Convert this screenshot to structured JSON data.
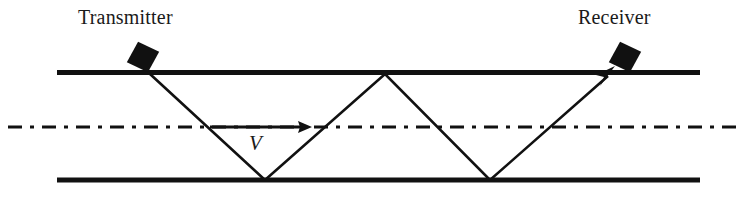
{
  "figure": {
    "title_absent": "",
    "background_color": "#ffffff",
    "stroke_color": "#111111",
    "width": 752,
    "height": 203
  },
  "labels": {
    "transmitter": "Transmitter",
    "receiver": "Receiver",
    "velocity": "V"
  },
  "icons": {
    "transmitter_marker": "black-diamond-marker",
    "receiver_marker": "black-diamond-marker",
    "velocity_arrow": "right-arrow",
    "ray_arrowhead": "up-right-arrowhead"
  },
  "geometry": {
    "top_boundary": {
      "x1": 57,
      "y1": 72,
      "x2": 700,
      "y2": 72,
      "thickness": 5
    },
    "bottom_boundary": {
      "x1": 57,
      "y1": 180,
      "x2": 700,
      "y2": 180,
      "thickness": 5
    },
    "center_line": {
      "x1": 8,
      "y1": 127,
      "x2": 744,
      "y2": 127,
      "thickness": 3,
      "style": "dash-dot"
    },
    "ray_path": [
      {
        "x": 150,
        "y": 74
      },
      {
        "x": 265,
        "y": 180
      },
      {
        "x": 385,
        "y": 74
      },
      {
        "x": 490,
        "y": 180
      },
      {
        "x": 610,
        "y": 74
      }
    ],
    "transmitter_marker": {
      "cx": 143,
      "cy": 57,
      "half_width": 17,
      "half_height": 16,
      "rotation_deg": -18
    },
    "receiver_marker": {
      "cx": 625,
      "cy": 57,
      "half_width": 17,
      "half_height": 16,
      "rotation_deg": -18
    },
    "velocity_arrow": {
      "x1": 210,
      "y1": 127,
      "x2": 310,
      "y2": 127,
      "thickness": 3
    }
  }
}
